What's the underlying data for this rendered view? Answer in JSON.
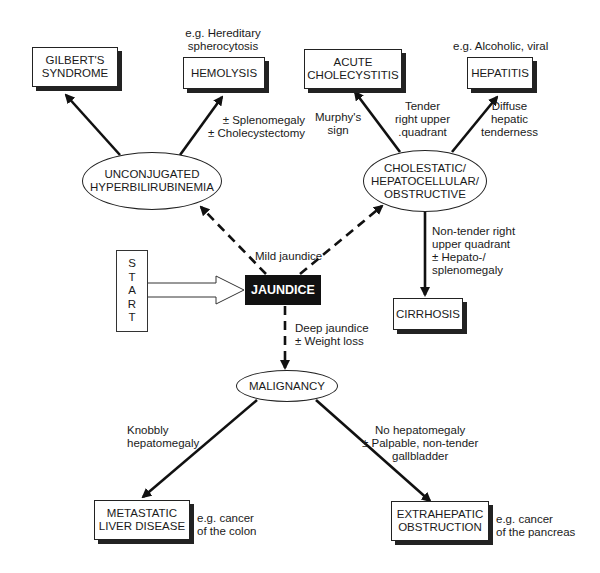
{
  "start": {
    "letters": [
      "S",
      "T",
      "A",
      "R",
      "T"
    ]
  },
  "center": {
    "label": "JAUNDICE"
  },
  "nodes": {
    "gilbert": "GILBERT'S\nSYNDROME",
    "hemolysis": "HEMOLYSIS",
    "acute_chole": "ACUTE\nCHOLECYSTITIS",
    "hepatitis": "HEPATITIS",
    "unconj": "UNCONJUGATED\nHYPERBILIRUBINEMIA",
    "cholestatic": "CHOLESTATIC/\nHEPATOCELLULAR/\nOBSTRUCTIVE",
    "cirrhosis": "CIRRHOSIS",
    "malignancy": "MALIGNANCY",
    "metastatic": "METASTATIC\nLIVER DISEASE",
    "extrahepatic": "EXTRAHEPATIC\nOBSTRUCTION"
  },
  "labels": {
    "hemolysis_eg": "e.g. Hereditary\nspherocytosis",
    "hepatitis_eg": "e.g. Alcoholic, viral",
    "splenomegaly": "± Splenomegaly\n± Cholecystectomy",
    "murphy": "Murphy's\nsign",
    "tender_ruq": "Tender\nright upper\n.quadrant",
    "diffuse": "Diffuse\nhepatic\ntenderness",
    "mild": "Mild jaundice",
    "nontender": "Non-tender right\nupper quadrant\n± Hepato-/\nsplenomegaly",
    "deep": "Deep jaundice\n± Weight loss",
    "knobbly": "Knobbly\nhepatomegaly",
    "nohepato": "No hepatomegaly\n± Palpable, non-tender\ngallbladder",
    "colon_eg": "e.g. cancer\nof the colon",
    "pancreas_eg": "e.g. cancer\nof the pancreas"
  }
}
